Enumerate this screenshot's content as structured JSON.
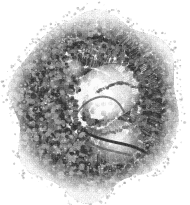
{
  "figure": {
    "caption": "",
    "kind": "natural-image",
    "staining_description": "grayscale halftone print of a stained tissue section",
    "background_color": "#ffffff",
    "ink_color": "#3a3a3a",
    "mid_tone_color": "#8a8a8a",
    "light_tone_color": "#c8c8c8",
    "width_px": 190,
    "height_px": 205,
    "alt_text": "Round grayscale micrograph of a coiled tissue section with concentric rings of densely packed cells and radial palisading columnar cell layers surrounding a pale central lumen."
  },
  "specimen": {
    "outline": {
      "center_x": 95,
      "center_y": 105,
      "radius_x": 84,
      "radius_y": 91,
      "shape": "irregular-round"
    },
    "regions": [
      {
        "name": "outer-cell-mass",
        "label": "Outer densely packed cell mass",
        "tone": "#6f6f6f",
        "texture": "round-nuclei-stipple"
      },
      {
        "name": "upper-palisade-band",
        "label": "Upper radial palisading band",
        "tone": "#4a4a4a",
        "texture": "radial-striations"
      },
      {
        "name": "right-palisade-band",
        "label": "Right radial palisading band",
        "tone": "#4a4a4a",
        "texture": "radial-striations"
      },
      {
        "name": "inner-spiral-band",
        "label": "Inner spiral cell band",
        "tone": "#5a5a5a",
        "texture": "radial-striations"
      },
      {
        "name": "central-lumen",
        "label": "Pale central lumen",
        "tone": "#f2f2f2",
        "texture": "clear"
      },
      {
        "name": "lower-duct",
        "label": "Lower curved duct wall",
        "tone": "#3f3f3f",
        "texture": "dense-line"
      },
      {
        "name": "lower-cell-mass",
        "label": "Lower cell mass",
        "tone": "#7a7a7a",
        "texture": "round-nuclei-stipple"
      }
    ],
    "noise": {
      "grain_amount": 0.18,
      "halftone": true,
      "halftone_pitch_px": 2
    }
  }
}
